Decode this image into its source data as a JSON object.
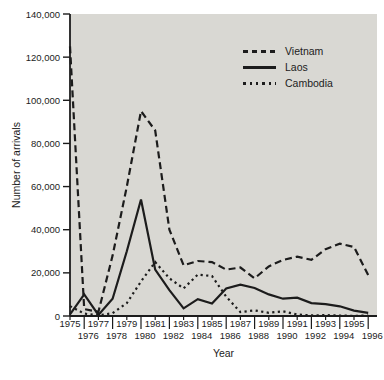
{
  "figure": {
    "background": "#ffffff",
    "plot_background": "#d9d8d3",
    "line_color": "#1c1c1c"
  },
  "chart_data": {
    "type": "line",
    "title": "",
    "xlabel": "Year",
    "ylabel": "Number of arrivals",
    "x": [
      1975,
      1976,
      1977,
      1978,
      1979,
      1980,
      1981,
      1982,
      1983,
      1984,
      1985,
      1986,
      1987,
      1988,
      1989,
      1990,
      1991,
      1992,
      1993,
      1994,
      1995,
      1996
    ],
    "ylim": [
      0,
      140000
    ],
    "ytick_step": 20000,
    "ytick_labels": [
      "0",
      "20,000",
      "40,000",
      "60,000",
      "80,000",
      "100,000",
      "120,000",
      "140,000"
    ],
    "grid": false,
    "legend_position": "top-right-inside",
    "series": [
      {
        "name": "Vietnam",
        "line_style": "dashed",
        "values": [
          125000,
          3200,
          1900,
          28000,
          60000,
          95000,
          86000,
          40000,
          23500,
          25500,
          25000,
          21500,
          22500,
          17500,
          23000,
          26000,
          27500,
          26000,
          31000,
          33500,
          32000,
          19000
        ]
      },
      {
        "name": "Laos",
        "line_style": "solid",
        "values": [
          800,
          10000,
          500,
          8000,
          30000,
          54000,
          21500,
          12000,
          3500,
          7800,
          5800,
          12800,
          14500,
          13000,
          10000,
          8000,
          8500,
          6000,
          5500,
          4500,
          2500,
          1500
        ]
      },
      {
        "name": "Cambodia",
        "line_style": "dotted",
        "values": [
          4600,
          1100,
          300,
          1300,
          6000,
          16000,
          25000,
          17500,
          12800,
          19200,
          18500,
          9000,
          1800,
          2600,
          1500,
          2200,
          700,
          300,
          400,
          200,
          100,
          200
        ]
      }
    ]
  }
}
